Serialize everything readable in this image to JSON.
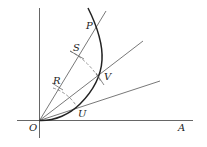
{
  "diagram": {
    "type": "geometric construction",
    "labels": {
      "P": "P",
      "S": "S",
      "R": "R",
      "V": "V",
      "U": "U",
      "O": "O",
      "A": "A"
    },
    "colors": {
      "line": "#555555",
      "curve": "#222222",
      "dashed": "#666666",
      "text": "#222222"
    }
  }
}
